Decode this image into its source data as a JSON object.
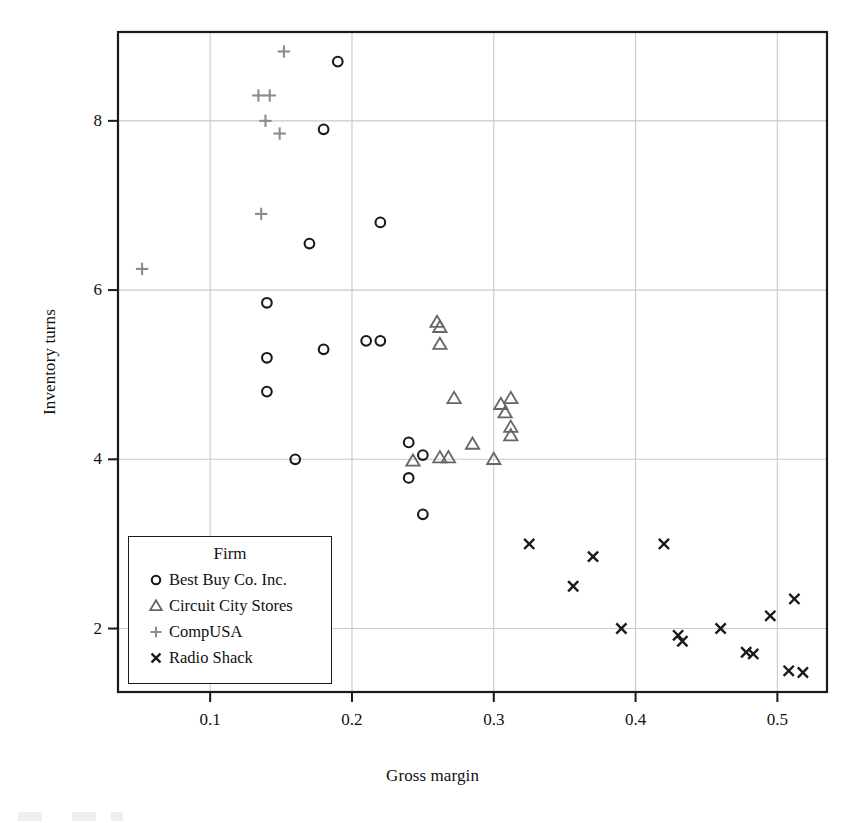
{
  "figure": {
    "background": "#ffffff",
    "frame_color": "#1a1a1a"
  },
  "axes": {
    "xlabel": "Gross margin",
    "ylabel": "Inventory turns",
    "xticks": [
      "0.1",
      "0.2",
      "0.3",
      "0.4",
      "0.5"
    ],
    "yticks": [
      "2",
      "4",
      "6",
      "8"
    ]
  },
  "legend": {
    "title": "Firm",
    "entries": [
      {
        "label": "Best Buy Co. Inc.",
        "marker": "circle-marker",
        "color": "#1a1a1a"
      },
      {
        "label": "Circuit City Stores",
        "marker": "triangle-marker",
        "color": "#666666"
      },
      {
        "label": "CompUSA",
        "marker": "plus-marker",
        "color": "#8c8c8c"
      },
      {
        "label": "Radio Shack",
        "marker": "cross-marker",
        "color": "#1a1a1a"
      }
    ]
  },
  "chart_data": {
    "type": "scatter",
    "title": "",
    "xlabel": "Gross margin",
    "ylabel": "Inventory turns",
    "xlim": [
      0.035,
      0.535
    ],
    "ylim": [
      1.25,
      9.05
    ],
    "xticks": [
      0.1,
      0.2,
      0.3,
      0.4,
      0.5
    ],
    "yticks": [
      2,
      4,
      6,
      8
    ],
    "grid": true,
    "legend_position": "lower-left-inside",
    "series": [
      {
        "name": "Best Buy Co. Inc.",
        "marker": "circle",
        "color": "#1a1a1a",
        "points": [
          [
            0.19,
            8.7
          ],
          [
            0.18,
            7.9
          ],
          [
            0.22,
            6.8
          ],
          [
            0.17,
            6.55
          ],
          [
            0.14,
            5.85
          ],
          [
            0.18,
            5.3
          ],
          [
            0.14,
            5.2
          ],
          [
            0.21,
            5.4
          ],
          [
            0.22,
            5.4
          ],
          [
            0.14,
            4.8
          ],
          [
            0.16,
            4.0
          ],
          [
            0.24,
            4.2
          ],
          [
            0.25,
            4.05
          ],
          [
            0.24,
            3.78
          ],
          [
            0.25,
            3.35
          ]
        ]
      },
      {
        "name": "Circuit City Stores",
        "marker": "triangle",
        "color": "#666666",
        "points": [
          [
            0.26,
            5.62
          ],
          [
            0.262,
            5.56
          ],
          [
            0.262,
            5.36
          ],
          [
            0.272,
            4.72
          ],
          [
            0.305,
            4.65
          ],
          [
            0.312,
            4.72
          ],
          [
            0.308,
            4.55
          ],
          [
            0.312,
            4.38
          ],
          [
            0.312,
            4.28
          ],
          [
            0.285,
            4.18
          ],
          [
            0.262,
            4.02
          ],
          [
            0.268,
            4.02
          ],
          [
            0.243,
            3.98
          ],
          [
            0.3,
            4.0
          ]
        ]
      },
      {
        "name": "CompUSA",
        "marker": "plus",
        "color": "#8c8c8c",
        "points": [
          [
            0.152,
            8.82
          ],
          [
            0.134,
            8.3
          ],
          [
            0.142,
            8.3
          ],
          [
            0.139,
            8.0
          ],
          [
            0.149,
            7.85
          ],
          [
            0.136,
            6.9
          ],
          [
            0.052,
            6.25
          ]
        ]
      },
      {
        "name": "Radio Shack",
        "marker": "cross",
        "color": "#1a1a1a",
        "points": [
          [
            0.325,
            3.0
          ],
          [
            0.37,
            2.85
          ],
          [
            0.42,
            3.0
          ],
          [
            0.356,
            2.5
          ],
          [
            0.512,
            2.35
          ],
          [
            0.495,
            2.15
          ],
          [
            0.39,
            2.0
          ],
          [
            0.46,
            2.0
          ],
          [
            0.43,
            1.92
          ],
          [
            0.433,
            1.85
          ],
          [
            0.478,
            1.72
          ],
          [
            0.483,
            1.7
          ],
          [
            0.508,
            1.5
          ],
          [
            0.518,
            1.48
          ]
        ]
      }
    ]
  }
}
